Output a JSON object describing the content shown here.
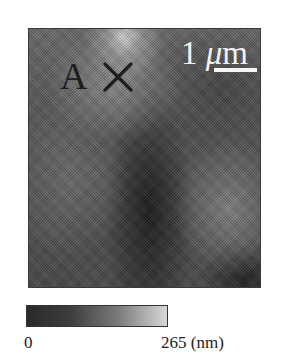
{
  "figure": {
    "type": "afm-height-map",
    "marker": {
      "letter": "A",
      "symbol": "×"
    },
    "scale_bar": {
      "value": "1",
      "unit_prefix": "μ",
      "unit": "m",
      "label": "1 μm"
    },
    "colorbar": {
      "min_label": "0",
      "max_label": "265 (nm)",
      "min": 0,
      "max": 265,
      "unit": "nm",
      "colors": {
        "low": "#2a2a2a",
        "high": "#d8d8d8"
      }
    }
  }
}
